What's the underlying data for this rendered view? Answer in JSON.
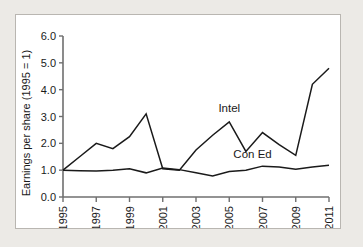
{
  "chart_data": {
    "type": "line",
    "title": "",
    "xlabel": "",
    "ylabel": "Earnings per share (1995 = 1)",
    "xlim": [
      1995,
      2011
    ],
    "ylim": [
      0.0,
      6.0
    ],
    "grid": false,
    "legend_position": "inline-annotation",
    "y_ticks": [
      "0.0",
      "1.0",
      "2.0",
      "3.0",
      "4.0",
      "5.0",
      "6.0"
    ],
    "y_tick_values": [
      0.0,
      1.0,
      2.0,
      3.0,
      4.0,
      5.0,
      6.0
    ],
    "x_ticks": [
      "1995",
      "1997",
      "1999",
      "2001",
      "2003",
      "2005",
      "2007",
      "2009",
      "2011"
    ],
    "x_tick_values": [
      1995,
      1997,
      1999,
      2001,
      2003,
      2005,
      2007,
      2009,
      2011
    ],
    "x": [
      1995,
      1996,
      1997,
      1998,
      1999,
      2000,
      2001,
      2002,
      2003,
      2004,
      2005,
      2006,
      2007,
      2008,
      2009,
      2010,
      2011
    ],
    "series": [
      {
        "name": "Intel",
        "label": "Intel",
        "color": "#1a1a1a",
        "label_x": 2005,
        "label_y": 3.15,
        "values": [
          1.0,
          1.5,
          2.0,
          1.8,
          2.25,
          3.1,
          1.05,
          1.0,
          1.75,
          2.3,
          2.8,
          1.7,
          2.4,
          1.95,
          1.55,
          4.2,
          4.8
        ]
      },
      {
        "name": "Con Ed",
        "label": "Con Ed",
        "color": "#1a1a1a",
        "label_x": 2006.4,
        "label_y": 1.45,
        "values": [
          1.0,
          0.98,
          0.97,
          1.0,
          1.05,
          0.9,
          1.08,
          1.02,
          0.9,
          0.78,
          0.95,
          1.0,
          1.15,
          1.12,
          1.03,
          1.12,
          1.18
        ]
      }
    ]
  },
  "figure": {
    "panel_background": "#ffffff",
    "page_background": "#eceae6",
    "border_color": "#b9b6b1",
    "axis_color": "#6f6f6f",
    "line_color": "#1a1a1a"
  }
}
